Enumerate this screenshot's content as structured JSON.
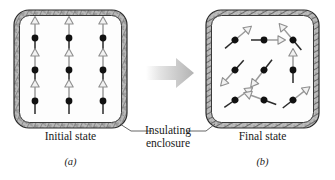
{
  "figure": {
    "type": "physics-diagram",
    "caption_style": "textbook",
    "background": "#ffffff",
    "ink": "#1a1a1a"
  },
  "labels": {
    "initial_state": "Initial state",
    "final_state": "Final state",
    "enclosure_line1": "Insulating",
    "enclosure_line2": "enclosure",
    "panel_a": "(a)",
    "panel_b": "(b)"
  },
  "colors": {
    "dipole_dot": "#111111",
    "dipole_arrow_outline": "#9a9a9a",
    "dipole_arrow_fill": "#f0f0f0",
    "wall_texture": "#8d8d8d",
    "wall_edge": "#2b2b2b",
    "interior": "#fdfdfd",
    "transition_arrow": "#c9c9c9",
    "leader_line": "#555555"
  },
  "panels": [
    {
      "id": "a",
      "name": "initial-state-panel",
      "label": "Initial state",
      "letter": "(a)",
      "box": {
        "x": 14,
        "y": 10,
        "width": 113,
        "height": 118,
        "corner_radius": 14,
        "wall_thickness": 5
      },
      "description": "Nine magnetic dipoles arranged in a 3x3 grid, all aligned pointing straight up (ordered, low entropy).",
      "dipoles": [
        {
          "cx": 35,
          "cy": 38,
          "angle_deg": 90
        },
        {
          "cx": 69,
          "cy": 38,
          "angle_deg": 90
        },
        {
          "cx": 103,
          "cy": 38,
          "angle_deg": 90
        },
        {
          "cx": 35,
          "cy": 70,
          "angle_deg": 90
        },
        {
          "cx": 69,
          "cy": 70,
          "angle_deg": 90
        },
        {
          "cx": 103,
          "cy": 70,
          "angle_deg": 90
        },
        {
          "cx": 35,
          "cy": 101,
          "angle_deg": 90
        },
        {
          "cx": 69,
          "cy": 101,
          "angle_deg": 90
        },
        {
          "cx": 103,
          "cy": 101,
          "angle_deg": 90
        }
      ]
    },
    {
      "id": "b",
      "name": "final-state-panel",
      "label": "Final state",
      "letter": "(b)",
      "box": {
        "x": 206,
        "y": 10,
        "width": 113,
        "height": 118,
        "corner_radius": 14,
        "wall_thickness": 5
      },
      "description": "Nine magnetic dipoles in a 3x3 grid with randomized orientations (disordered, higher entropy).",
      "dipoles": [
        {
          "cx": 235,
          "cy": 40,
          "angle_deg": 40
        },
        {
          "cx": 264,
          "cy": 40,
          "angle_deg": 0
        },
        {
          "cx": 293,
          "cy": 40,
          "angle_deg": 130
        },
        {
          "cx": 235,
          "cy": 70,
          "angle_deg": 228
        },
        {
          "cx": 264,
          "cy": 70,
          "angle_deg": 232
        },
        {
          "cx": 293,
          "cy": 70,
          "angle_deg": 90
        },
        {
          "cx": 235,
          "cy": 100,
          "angle_deg": 35
        },
        {
          "cx": 264,
          "cy": 100,
          "angle_deg": 160
        },
        {
          "cx": 293,
          "cy": 100,
          "angle_deg": 38
        }
      ]
    }
  ],
  "transition_arrow": {
    "name": "transition-arrow",
    "direction": "right",
    "from_panel": "a",
    "to_panel": "b",
    "x": 146,
    "y": 58,
    "width": 48,
    "height": 30
  },
  "leader_lines": [
    {
      "name": "leader-to-left-enclosure",
      "from": [
        152,
        131
      ],
      "to": [
        120,
        124
      ],
      "target_panel": "a"
    },
    {
      "name": "leader-to-right-enclosure",
      "from": [
        186,
        131
      ],
      "to": [
        214,
        124
      ],
      "target_panel": "b"
    }
  ],
  "label_positions": {
    "initial_state": {
      "x": 14,
      "y": 130,
      "width": 113
    },
    "final_state": {
      "x": 206,
      "y": 130,
      "width": 113
    },
    "enclosure": {
      "x": 131,
      "y": 124,
      "width": 74
    },
    "panel_a": {
      "x": 14,
      "y": 156,
      "width": 113
    },
    "panel_b": {
      "x": 206,
      "y": 156,
      "width": 113
    }
  }
}
